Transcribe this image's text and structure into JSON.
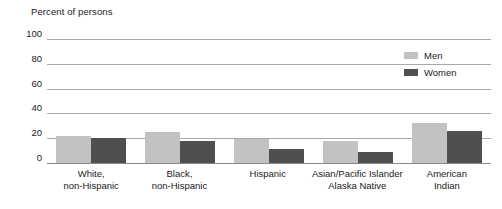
{
  "chart_data": {
    "type": "bar",
    "title": "Percent of persons",
    "xlabel": "",
    "ylabel": "Percent of persons",
    "ylim": [
      0,
      100
    ],
    "yticks": [
      100,
      80,
      60,
      40,
      20,
      0
    ],
    "grid": true,
    "legend_position": "top-right",
    "categories": [
      "White,\nnon-Hispanic",
      "Black,\nnon-Hispanic",
      "Hispanic",
      "Asian/Pacific Islander\nAlaska Native",
      "American\nIndian"
    ],
    "category_lines": [
      [
        "White,",
        "non-Hispanic"
      ],
      [
        "Black,",
        "non-Hispanic"
      ],
      [
        "Hispanic",
        ""
      ],
      [
        "Asian/Pacific Islander",
        "Alaska Native"
      ],
      [
        "American",
        "Indian"
      ]
    ],
    "series": [
      {
        "name": "Men",
        "color": "#c2c2c2",
        "values": [
          22,
          25,
          19,
          18,
          32
        ]
      },
      {
        "name": "Women",
        "color": "#4f4f4f",
        "values": [
          20,
          18,
          11,
          9,
          26
        ]
      }
    ]
  },
  "colors": {
    "men": "#c2c2c2",
    "women": "#4f4f4f",
    "gridline": "#a9a9a9",
    "axis": "#8a8a8a",
    "text": "#1a1a1a",
    "background": "#ffffff"
  }
}
